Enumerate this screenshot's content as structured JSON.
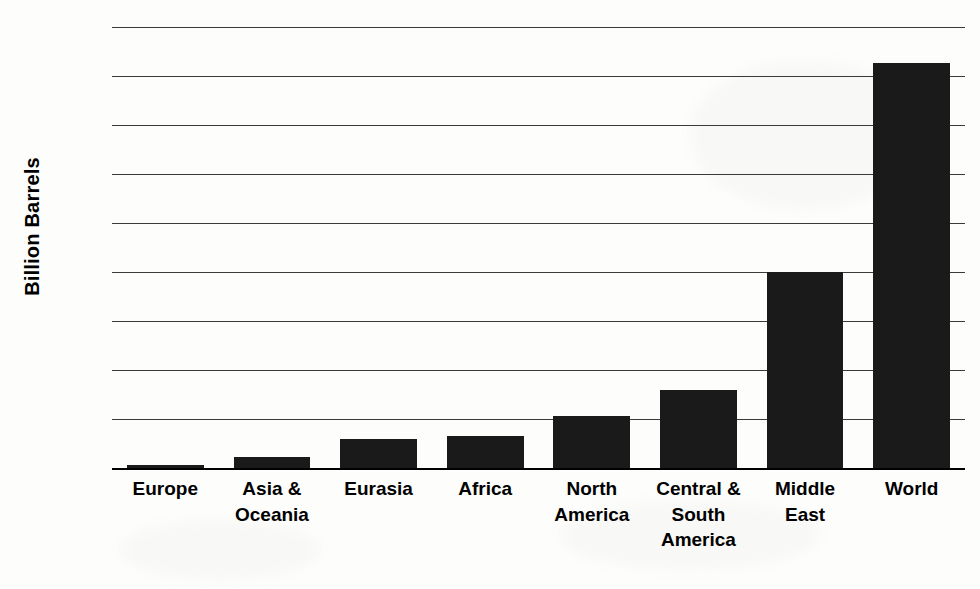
{
  "chart_data": {
    "type": "bar",
    "title": "",
    "subtitle": "",
    "xlabel": "",
    "ylabel": "Billion Barrels",
    "ylim": [
      0,
      1800
    ],
    "y_ticks": [
      1800,
      1600,
      1400,
      1200,
      1000,
      800,
      600,
      400,
      200,
      0
    ],
    "grid": true,
    "legend": false,
    "legend_position": "none",
    "bar_color": "#1a1a1a",
    "categories": [
      "Europe",
      "Asia &\nOceania",
      "Eurasia",
      "Africa",
      "North\nAmerica",
      "Central &\nSouth\nAmerica",
      "Middle\nEast",
      "World"
    ],
    "values": [
      12,
      45,
      120,
      130,
      213,
      320,
      800,
      1655
    ]
  },
  "axis": {
    "y_title": "Billion Barrels"
  },
  "colors": {
    "bar": "#1a1a1a",
    "gridline": "#3a3a3a",
    "baseline": "#000000",
    "background": "#fdfdfc",
    "text": "#000000"
  }
}
